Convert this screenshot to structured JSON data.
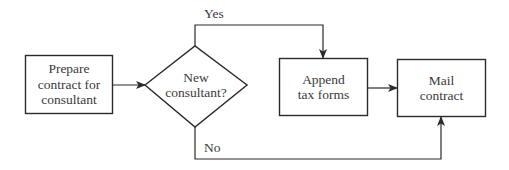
{
  "diagram": {
    "type": "flowchart",
    "stroke_color": "#2b2b2b",
    "background": "#ffffff",
    "nodes": [
      {
        "id": "prepare",
        "shape": "rectangle",
        "label": "Prepare\ncontract for\nconsultant"
      },
      {
        "id": "decision",
        "shape": "diamond",
        "label": "New\nconsultant?"
      },
      {
        "id": "append",
        "shape": "rectangle",
        "label": "Append\ntax forms"
      },
      {
        "id": "mail",
        "shape": "rectangle",
        "label": "Mail\ncontract"
      }
    ],
    "edges": [
      {
        "from": "prepare",
        "to": "decision",
        "label": ""
      },
      {
        "from": "decision",
        "to": "append",
        "label": "Yes"
      },
      {
        "from": "append",
        "to": "mail",
        "label": ""
      },
      {
        "from": "decision",
        "to": "mail",
        "label": "No"
      }
    ],
    "labels": {
      "prepare": "Prepare\ncontract for\nconsultant",
      "decision": "New\nconsultant?",
      "append": "Append\ntax forms",
      "mail": "Mail\ncontract",
      "yes": "Yes",
      "no": "No"
    }
  }
}
